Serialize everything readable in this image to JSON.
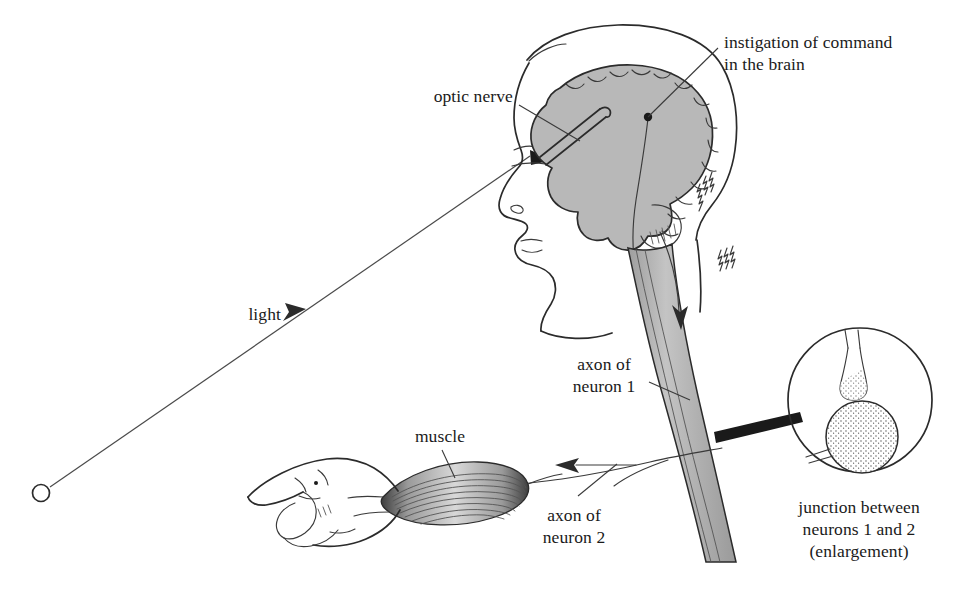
{
  "figure": {
    "background_color": "#ffffff",
    "ink_color": "#2b2b2b",
    "fill_gray": "#b8b8b8"
  },
  "labels": {
    "optic_nerve": "optic nerve",
    "instigation_line1": "instigation of command",
    "instigation_line2": "in the brain",
    "light": "light",
    "axon1_line1": "axon of",
    "axon1_line2": "neuron 1",
    "axon2_line1": "axon of",
    "axon2_line2": "neuron 2",
    "muscle": "muscle",
    "junction_line1": "junction between",
    "junction_line2": "neurons 1 and 2",
    "junction_line3": "(enlargement)"
  },
  "parts": {
    "light_source": "light-source-circle",
    "light_ray": "light-ray-line",
    "light_ray_arrow": "light-direction-arrow",
    "head": "head-profile-outline",
    "brain": "brain-gray-matter",
    "cerebellum": "cerebellum",
    "optic_nerve_tube": "optic-nerve-tube",
    "eye": "eye-wedge",
    "command_dot": "command-origin-dot",
    "spinal_cord": "spinal-cord-band",
    "descending_arrow": "descending-signal-arrow",
    "motor_nerve": "motor-nerve-to-muscle",
    "motor_arrow": "motor-signal-arrow",
    "muscle_body": "muscle-spindle",
    "hand": "hand-outline",
    "magnifier": "synapse-enlargement-circle",
    "synapse_terminal": "presynaptic-terminal",
    "cell_body": "postsynaptic-cell-body",
    "connector_wedge": "enlargement-connector-wedge",
    "hair": "hair-strands"
  }
}
